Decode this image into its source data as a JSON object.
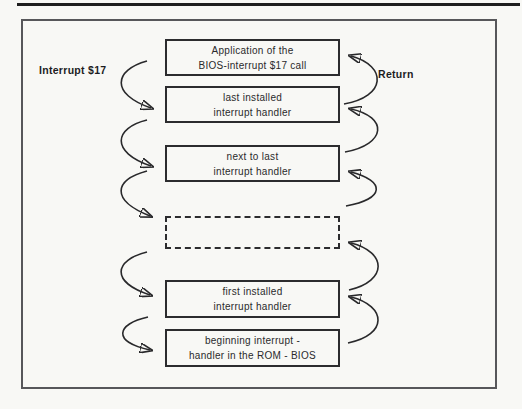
{
  "figure": {
    "labels": {
      "interrupt_call": "Interrupt $17",
      "return_path": "Return"
    },
    "boxes": [
      {
        "id": "application",
        "style": "solid",
        "line1": "Application of the",
        "line2": "BIOS-interrupt $17 call"
      },
      {
        "id": "last-installed",
        "style": "solid",
        "line1": "last installed",
        "line2": "interrupt handler"
      },
      {
        "id": "next-to-last",
        "style": "solid",
        "line1": "next to last",
        "line2": "interrupt handler"
      },
      {
        "id": "ellipsis",
        "style": "dashed",
        "line1": "",
        "line2": ""
      },
      {
        "id": "first-installed",
        "style": "solid",
        "line1": "first installed",
        "line2": "interrupt handler"
      },
      {
        "id": "rom-bios",
        "style": "solid",
        "line1": "beginning interrupt -",
        "line2": "handler in the ROM - BIOS"
      }
    ],
    "colors": {
      "paper": "#f8f8f5",
      "ink": "#29292b",
      "frame": "#57575a",
      "rule": "#1e1e1e"
    }
  }
}
